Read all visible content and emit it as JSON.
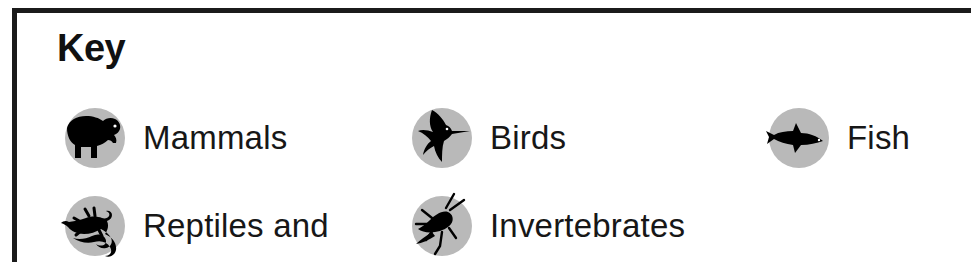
{
  "panel": {
    "title": "Key",
    "border_color": "#1b1b1b",
    "background_color": "#ffffff",
    "icon_disc_color": "#b9b9b9",
    "silhouette_color": "#000000",
    "text_color": "#171717"
  },
  "legend": {
    "rows": [
      {
        "items": [
          {
            "label": "Mammals",
            "icon": "bear-silhouette-icon"
          },
          {
            "label": "Birds",
            "icon": "hummingbird-silhouette-icon"
          },
          {
            "label": "Fish",
            "icon": "fish-silhouette-icon"
          }
        ]
      },
      {
        "items": [
          {
            "label": "Reptiles and",
            "icon": "lizard-silhouette-icon"
          },
          {
            "label": "Invertebrates",
            "icon": "cricket-silhouette-icon"
          }
        ]
      }
    ]
  }
}
